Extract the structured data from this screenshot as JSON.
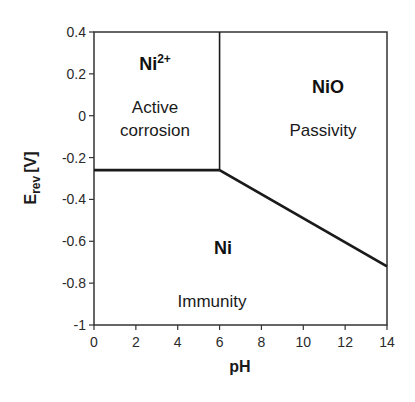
{
  "chart_data": {
    "type": "line",
    "title": "",
    "subtitle": "Pourbaix diagram of Nickel",
    "xlabel": "pH",
    "ylabel": "E_rev [V]",
    "ylabel_main": "E",
    "ylabel_sub": "rev",
    "ylabel_unit": "[V]",
    "xlim": [
      0,
      14
    ],
    "ylim": [
      -1,
      0.4
    ],
    "xticks": [
      0,
      2,
      4,
      6,
      8,
      10,
      12,
      14
    ],
    "yticks": [
      0.4,
      0.2,
      0,
      -0.2,
      -0.4,
      -0.6,
      -0.8,
      -1
    ],
    "xtick_labels": [
      "0",
      "2",
      "4",
      "6",
      "8",
      "10",
      "12",
      "14"
    ],
    "ytick_labels": [
      "0.4",
      "0.2",
      "0",
      "-0.2",
      "-0.4",
      "-0.6",
      "-0.8",
      "-1"
    ],
    "grid": false,
    "legend": null,
    "series": [
      {
        "name": "Ni / Ni2+ boundary",
        "x": [
          0,
          6
        ],
        "y": [
          -0.26,
          -0.26
        ]
      },
      {
        "name": "Ni2+ / NiO boundary",
        "x": [
          6,
          6
        ],
        "y": [
          -0.26,
          0.4
        ]
      },
      {
        "name": "Ni / NiO boundary",
        "x": [
          6,
          14
        ],
        "y": [
          -0.26,
          -0.72
        ]
      }
    ],
    "regions": [
      {
        "species": "Ni",
        "superscript": "2+",
        "label": "Active corrosion",
        "label_lines": [
          "Active",
          "corrosion"
        ]
      },
      {
        "species": "NiO",
        "superscript": "",
        "label": "Passivity",
        "label_lines": [
          "Passivity"
        ]
      },
      {
        "species": "Ni",
        "superscript": "",
        "label": "Immunity",
        "label_lines": [
          "Immunity"
        ]
      }
    ],
    "line_color": "#1a1a1a",
    "frame_color": "#333333"
  }
}
